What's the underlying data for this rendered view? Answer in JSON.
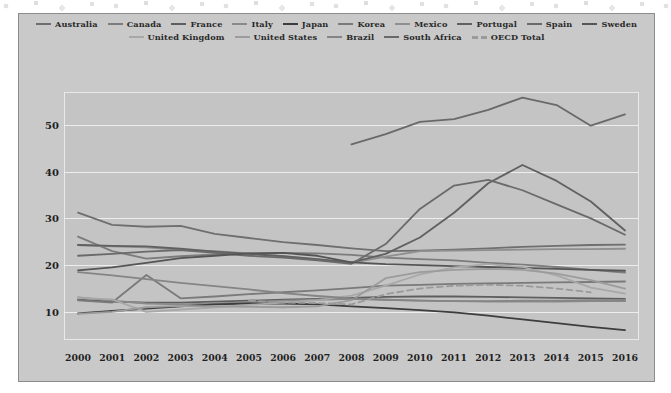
{
  "figure": {
    "background_color": "#c9c9c9",
    "plot_background_color": "#c4c4c4",
    "grid_color": "#ededed",
    "border_color": "#8c8c8c"
  },
  "chart_data": {
    "type": "line",
    "title": "",
    "xlabel": "",
    "ylabel": "",
    "xlim": [
      2000,
      2016
    ],
    "ylim": [
      4,
      57
    ],
    "yticks": [
      10,
      20,
      30,
      40,
      50
    ],
    "grid": true,
    "legend_position": "top",
    "x": [
      2000,
      2001,
      2002,
      2003,
      2004,
      2005,
      2006,
      2007,
      2008,
      2009,
      2010,
      2011,
      2012,
      2013,
      2014,
      2015,
      2016
    ],
    "series": [
      {
        "name": "Australia",
        "color": "#6f6f6f",
        "style": "solid",
        "values": [
          31.2,
          28.6,
          28.2,
          28.4,
          26.7,
          25.8,
          24.9,
          24.3,
          23.6,
          23.0,
          23.1,
          23.3,
          23.6,
          23.9,
          24.1,
          24.3,
          24.4
        ]
      },
      {
        "name": "Canada",
        "color": "#7c7c7c",
        "style": "solid",
        "values": [
          26.1,
          23.0,
          21.4,
          21.9,
          22.3,
          22.5,
          22.6,
          22.5,
          22.2,
          21.6,
          21.3,
          21.0,
          20.5,
          20.1,
          19.6,
          19.0,
          18.4
        ]
      },
      {
        "name": "France",
        "color": "#5e5e5e",
        "style": "solid",
        "values": [
          12.6,
          12.2,
          12.0,
          12.0,
          12.2,
          12.4,
          12.6,
          12.8,
          13.0,
          13.2,
          13.3,
          13.3,
          13.2,
          13.1,
          13.0,
          12.9,
          12.8
        ]
      },
      {
        "name": "Italy",
        "color": "#8a8a8a",
        "style": "solid",
        "values": [
          13.1,
          12.4,
          11.8,
          11.6,
          11.8,
          12.1,
          12.4,
          12.6,
          12.8,
          12.6,
          12.4,
          12.3,
          12.2,
          12.2,
          12.2,
          12.3,
          12.3
        ]
      },
      {
        "name": "Japan",
        "color": "#3d3d3d",
        "style": "solid",
        "values": [
          9.7,
          10.2,
          10.7,
          11.2,
          11.6,
          11.8,
          11.8,
          11.6,
          11.2,
          10.8,
          10.4,
          9.9,
          9.2,
          8.4,
          7.6,
          6.8,
          6.1
        ]
      },
      {
        "name": "Korea",
        "color": "#7a7a7a",
        "style": "solid",
        "values": [
          12.5,
          12.0,
          17.9,
          12.9,
          13.3,
          13.8,
          14.2,
          14.6,
          15.1,
          15.6,
          15.8,
          16.0,
          16.1,
          16.2,
          16.3,
          16.4,
          16.5
        ]
      },
      {
        "name": "Mexico",
        "color": "#8f8f8f",
        "style": "solid",
        "values": [
          24.3,
          24.0,
          23.8,
          23.2,
          23.0,
          22.5,
          21.9,
          21.2,
          20.5,
          21.8,
          23.0,
          23.1,
          23.2,
          23.3,
          23.4,
          23.4,
          23.5
        ]
      },
      {
        "name": "Portugal",
        "color": "#606060",
        "style": "solid",
        "values": [
          24.3,
          24.1,
          24.0,
          23.5,
          22.9,
          22.4,
          21.9,
          21.3,
          20.6,
          22.4,
          25.9,
          31.2,
          37.5,
          41.4,
          38.0,
          33.6,
          27.4
        ]
      },
      {
        "name": "Spain",
        "color": "#6a6a6a",
        "style": "solid",
        "values": [
          22.0,
          22.4,
          22.9,
          23.2,
          22.6,
          22.0,
          21.6,
          21.0,
          20.3,
          24.5,
          32.0,
          37.0,
          38.2,
          36.0,
          33.0,
          30.0,
          26.5
        ]
      },
      {
        "name": "Sweden",
        "color": "#555555",
        "style": "solid",
        "values": [
          18.9,
          19.5,
          20.5,
          21.5,
          22.0,
          22.5,
          22.6,
          22.0,
          20.6,
          20.2,
          20.0,
          19.8,
          19.6,
          19.4,
          19.2,
          19.0,
          18.8
        ]
      },
      {
        "name": "United Kingdom",
        "color": "#a8a8a8",
        "style": "solid",
        "values": [
          13.0,
          12.7,
          10.0,
          10.5,
          11.0,
          11.5,
          12.0,
          12.5,
          13.5,
          15.6,
          18.0,
          19.5,
          20.2,
          19.6,
          17.8,
          15.2,
          13.9
        ]
      },
      {
        "name": "United States",
        "color": "#9c9c9c",
        "style": "solid",
        "values": [
          9.6,
          10.0,
          11.0,
          11.3,
          11.2,
          11.1,
          11.0,
          11.2,
          12.5,
          17.2,
          18.5,
          19.0,
          19.2,
          19.0,
          18.2,
          16.8,
          15.0
        ]
      },
      {
        "name": "Brazil",
        "color": "#858585",
        "style": "solid",
        "values": [
          18.5,
          17.8,
          17.0,
          16.2,
          15.5,
          14.8,
          14.0,
          13.4,
          12.9,
          12.6,
          12.4,
          12.3,
          12.3,
          12.4,
          12.4,
          12.5,
          12.5
        ]
      },
      {
        "name": "South Africa",
        "color": "#696969",
        "style": "solid",
        "values": [
          null,
          null,
          null,
          null,
          null,
          null,
          null,
          null,
          45.8,
          48.0,
          50.6,
          51.2,
          53.2,
          55.8,
          54.2,
          49.8,
          52.2
        ]
      },
      {
        "name": "OECD Total",
        "color": "#9a9a9a",
        "style": "dashed",
        "values": [
          null,
          null,
          null,
          null,
          null,
          12.4,
          12.0,
          11.9,
          11.6,
          13.8,
          15.0,
          15.6,
          15.8,
          15.6,
          15.0,
          14.2,
          null
        ]
      }
    ]
  },
  "axes": {
    "y_tick_labels": [
      "10",
      "20",
      "30",
      "40",
      "50"
    ],
    "x_tick_labels": [
      "2000",
      "2001",
      "2002",
      "2003",
      "2004",
      "2005",
      "2006",
      "2007",
      "2008",
      "2009",
      "2010",
      "2011",
      "2012",
      "2013",
      "2014",
      "2015",
      "2016"
    ]
  },
  "legend": {
    "rows": [
      [
        "Australia",
        "Canada",
        "France",
        "Italy",
        "Japan",
        "Korea",
        "Mexico",
        "Portugal",
        "Spain",
        "Sweden"
      ],
      [
        "United Kingdom",
        "United States",
        "Brazil",
        "South Africa",
        "OECD Total"
      ]
    ]
  }
}
